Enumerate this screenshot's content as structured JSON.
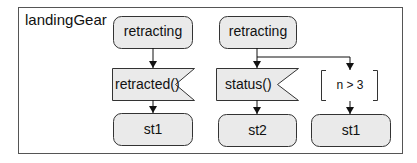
{
  "frame": {
    "title": "landingGear"
  },
  "colors": {
    "fill": "#eaeaea",
    "stroke": "#333333",
    "frame_stroke": "#555555"
  },
  "flows": [
    {
      "source_state": "retracting",
      "trigger": {
        "type": "receive-signal",
        "label": "retracted()"
      },
      "target_state": "st1"
    },
    {
      "source_state": "retracting",
      "branches": [
        {
          "trigger": {
            "type": "receive-signal",
            "label": "status()"
          },
          "target_state": "st2"
        },
        {
          "guard": {
            "type": "guard",
            "label": "n > 3"
          },
          "target_state": "st1"
        }
      ]
    }
  ]
}
